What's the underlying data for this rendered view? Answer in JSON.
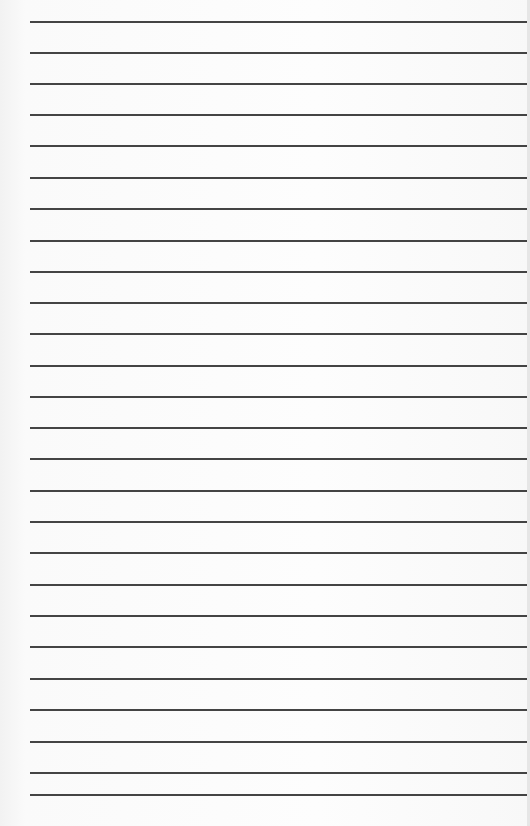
{
  "page": {
    "type": "lined-paper",
    "line_color": "#2a2a2a",
    "background_color": "#fbfbfb",
    "lines_y": [
      21,
      52,
      83,
      114,
      145,
      177,
      208,
      240,
      271,
      302,
      333,
      365,
      396,
      427,
      458,
      490,
      521,
      552,
      584,
      615,
      646,
      678,
      709,
      741,
      772,
      794
    ]
  }
}
